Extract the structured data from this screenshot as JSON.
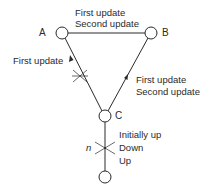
{
  "diagram": {
    "nodes": [
      {
        "id": "A",
        "label": "A"
      },
      {
        "id": "B",
        "label": "B"
      },
      {
        "id": "C",
        "label": "C"
      },
      {
        "id": "D",
        "label": ""
      }
    ],
    "edges": {
      "ab": {
        "from": "A",
        "to": "B",
        "labels": [
          "First update",
          "Second update"
        ]
      },
      "ca": {
        "from": "C",
        "to": "A",
        "labels": [
          "First update"
        ],
        "arrow": "toward A",
        "cut": true
      },
      "cb": {
        "from": "C",
        "to": "B",
        "labels": [
          "First update",
          "Second update"
        ],
        "arrow": "toward B"
      },
      "cd": {
        "from": "C",
        "to": "D",
        "link_name": "n",
        "labels": [
          "Initially up",
          "Down",
          "Up"
        ],
        "cut": true
      }
    }
  },
  "colors": {
    "line": "#2a2a2a",
    "background": "#ffffff"
  }
}
